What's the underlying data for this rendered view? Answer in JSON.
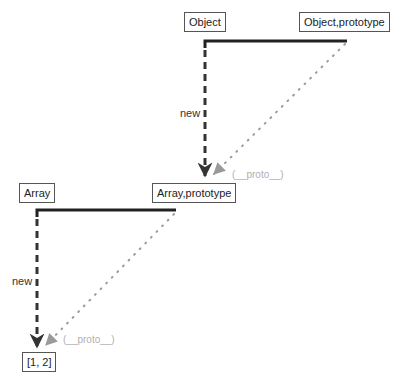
{
  "diagram": {
    "nodes": {
      "object": {
        "label": "Object"
      },
      "object_prototype": {
        "label": "Object,prototype"
      },
      "array": {
        "label": "Array"
      },
      "array_prototype": {
        "label": "Array,prototype"
      },
      "instance": {
        "label": "[1, 2]"
      }
    },
    "edges": {
      "object_new": {
        "label": "new",
        "from": "Object",
        "to": "Array,prototype",
        "style": "dashed"
      },
      "object_proto": {
        "label": "(__proto__)",
        "from": "Object,prototype",
        "to": "Array,prototype",
        "style": "dotted"
      },
      "array_new": {
        "label": "new",
        "from": "Array",
        "to": "[1, 2]",
        "style": "dashed"
      },
      "array_proto": {
        "label": "(__proto__)",
        "from": "Array,prototype",
        "to": "[1, 2]",
        "style": "dotted"
      }
    },
    "colors": {
      "solid_line": "#222222",
      "dashed_line": "#333333",
      "dotted_line": "#9a9a9a",
      "proto_label": "#b0b0b0"
    }
  }
}
